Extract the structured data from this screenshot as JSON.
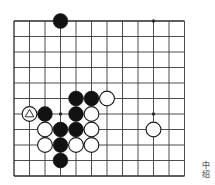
{
  "diagram": {
    "type": "go-board-diagram",
    "title": "",
    "board": {
      "origin_x": 14,
      "origin_y": 21,
      "spacing": 15.5,
      "cols": 12,
      "rows": 11,
      "line_color": "#3a3a3a",
      "edge_color": "#2a2a2a",
      "background": "#ffffff",
      "stone_radius": 7.4
    },
    "star_points": [
      {
        "col": 3,
        "row": 0
      },
      {
        "col": 9,
        "row": 0
      },
      {
        "col": 3,
        "row": 6
      },
      {
        "col": 9,
        "row": 6
      }
    ],
    "stones": [
      {
        "col": 3,
        "row": 0,
        "color": "black",
        "marker": "none"
      },
      {
        "col": 4,
        "row": 5,
        "color": "black",
        "marker": "none"
      },
      {
        "col": 5,
        "row": 5,
        "color": "black",
        "marker": "none"
      },
      {
        "col": 6,
        "row": 5,
        "color": "white",
        "marker": "none"
      },
      {
        "col": 1,
        "row": 6,
        "color": "white",
        "marker": "triangle"
      },
      {
        "col": 2,
        "row": 6,
        "color": "black",
        "marker": "none"
      },
      {
        "col": 4,
        "row": 6,
        "color": "black",
        "marker": "none"
      },
      {
        "col": 5,
        "row": 6,
        "color": "white",
        "marker": "none"
      },
      {
        "col": 2,
        "row": 7,
        "color": "white",
        "marker": "none"
      },
      {
        "col": 3,
        "row": 7,
        "color": "black",
        "marker": "none"
      },
      {
        "col": 4,
        "row": 7,
        "color": "black",
        "marker": "none"
      },
      {
        "col": 5,
        "row": 7,
        "color": "white",
        "marker": "none"
      },
      {
        "col": 9,
        "row": 7,
        "color": "white",
        "marker": "none"
      },
      {
        "col": 2,
        "row": 8,
        "color": "white",
        "marker": "none"
      },
      {
        "col": 3,
        "row": 8,
        "color": "black",
        "marker": "none"
      },
      {
        "col": 4,
        "row": 8,
        "color": "white",
        "marker": "none"
      },
      {
        "col": 5,
        "row": 8,
        "color": "white",
        "marker": "none"
      },
      {
        "col": 3,
        "row": 9,
        "color": "black",
        "marker": "none"
      }
    ],
    "colors": {
      "black_stone": "#121212",
      "white_stone": "#ffffff",
      "stone_outline": "#1a1a1a",
      "marker_white_on_white": "#1a1a1a"
    }
  },
  "caption": {
    "text_vertical": [
      "中",
      "â"
    ],
    "chars": [
      "中",
      "绍"
    ],
    "label": "caption-vertical-text"
  }
}
